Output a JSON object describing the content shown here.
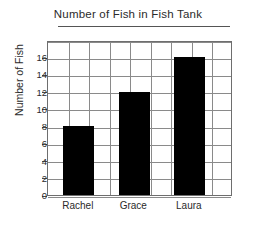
{
  "chart_data": {
    "type": "bar",
    "title": "Number of Fish in Fish Tank",
    "xlabel": "",
    "ylabel": "Number of Fish",
    "categories": [
      "Rachel",
      "Grace",
      "Laura"
    ],
    "values": [
      8,
      12,
      16
    ],
    "ylim": [
      0,
      18
    ],
    "ytick_labels": [
      "0",
      "2",
      "4",
      "6",
      "8",
      "10",
      "12",
      "14",
      "16"
    ],
    "ytick_values": [
      0,
      2,
      4,
      6,
      8,
      10,
      12,
      14,
      16
    ],
    "grid": true,
    "legend": "none",
    "bar_color": "#000000",
    "grid_color": "#8a8a8a",
    "axis_color": "#6e6e6e",
    "text_color": "#2b2b2b",
    "title_underlined": true,
    "series": [
      {
        "name": "Number of Fish",
        "values": [
          8,
          12,
          16
        ]
      }
    ]
  }
}
